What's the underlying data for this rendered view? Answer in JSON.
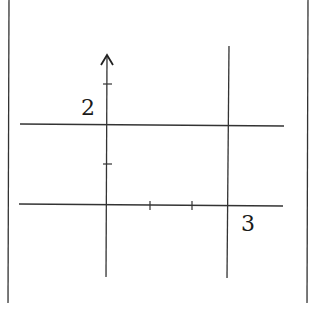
{
  "diagram": {
    "type": "coordinate-plane-sketch",
    "labels": {
      "y_value": "2",
      "x_value": "3"
    },
    "lines": [
      {
        "name": "y-axis",
        "kind": "axis-with-arrow"
      },
      {
        "name": "x-axis",
        "kind": "axis"
      },
      {
        "name": "horizontal-line",
        "equation": "y = 2"
      },
      {
        "name": "vertical-line",
        "equation": "x = 3"
      }
    ],
    "ticks": {
      "y_axis_count": 2,
      "x_axis_count": 2
    },
    "colors": {
      "stroke": "#333333",
      "background": "#ffffff"
    }
  }
}
